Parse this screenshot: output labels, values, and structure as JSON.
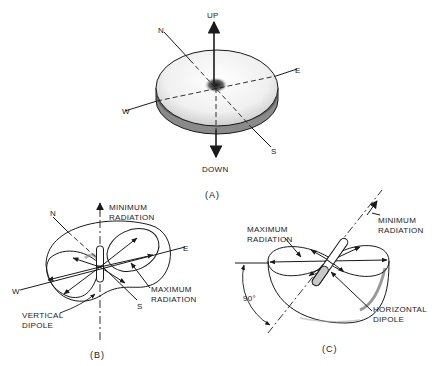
{
  "figure_a": {
    "caption": "(A)",
    "labels": {
      "up": "UP",
      "down": "DOWN",
      "north": "N",
      "south": "S",
      "east": "E",
      "west": "W"
    }
  },
  "figure_b": {
    "caption": "(B)",
    "labels": {
      "north": "N",
      "south": "S",
      "east": "E",
      "west": "W",
      "min_radiation_1": "MINIMUM",
      "min_radiation_2": "RADIATION",
      "max_radiation_1": "MAXIMUM",
      "max_radiation_2": "RADIATION",
      "dipole_1": "VERTICAL",
      "dipole_2": "DIPOLE"
    }
  },
  "figure_c": {
    "caption": "(C)",
    "labels": {
      "max_radiation_1": "MAXIMUM",
      "max_radiation_2": "RADIATION",
      "min_radiation_1": "MINIMUM",
      "min_radiation_2": "RADIATION",
      "angle": "90°",
      "dipole_1": "HORIZONTAL",
      "dipole_2": "DIPOLE"
    }
  },
  "colors": {
    "ink": "#1a1a1a",
    "paper": "#ffffff"
  }
}
